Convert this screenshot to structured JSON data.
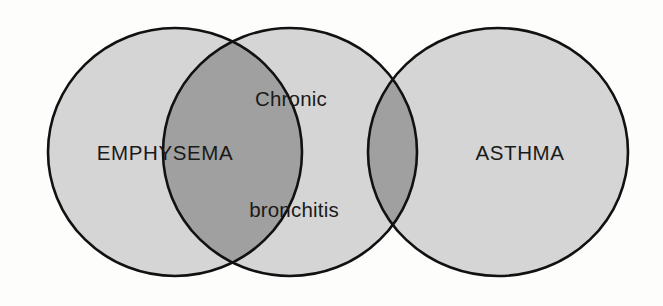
{
  "diagram": {
    "type": "venn",
    "background_color": "#fdfdfc",
    "circle_fill": "#d5d5d5",
    "overlap_fill": "#a0a0a0",
    "stroke_color": "#111111",
    "text_color": "#1a1a1a",
    "sets": [
      {
        "id": "emphysema",
        "label": "EMPHYSEMA",
        "cx": 175,
        "cy": 152,
        "rx": 127,
        "ry": 124,
        "label_x": 165,
        "label_y": 155
      },
      {
        "id": "chronic-bronchitis",
        "label_line1": "Chronic",
        "label_line2": "bronchitis",
        "cx": 290,
        "cy": 152,
        "rx": 127,
        "ry": 124,
        "label1_x": 291,
        "label1_y": 101,
        "label2_x": 294,
        "label2_y": 212
      },
      {
        "id": "asthma",
        "label": "ASTHMA",
        "cx": 498,
        "cy": 152,
        "rx": 130,
        "ry": 124,
        "label_x": 520,
        "label_y": 155
      }
    ],
    "overlaps": [
      {
        "id": "emphysema-chronic-bronchitis",
        "between": [
          "emphysema",
          "chronic-bronchitis"
        ]
      },
      {
        "id": "chronic-bronchitis-asthma",
        "between": [
          "chronic-bronchitis",
          "asthma"
        ]
      }
    ]
  }
}
